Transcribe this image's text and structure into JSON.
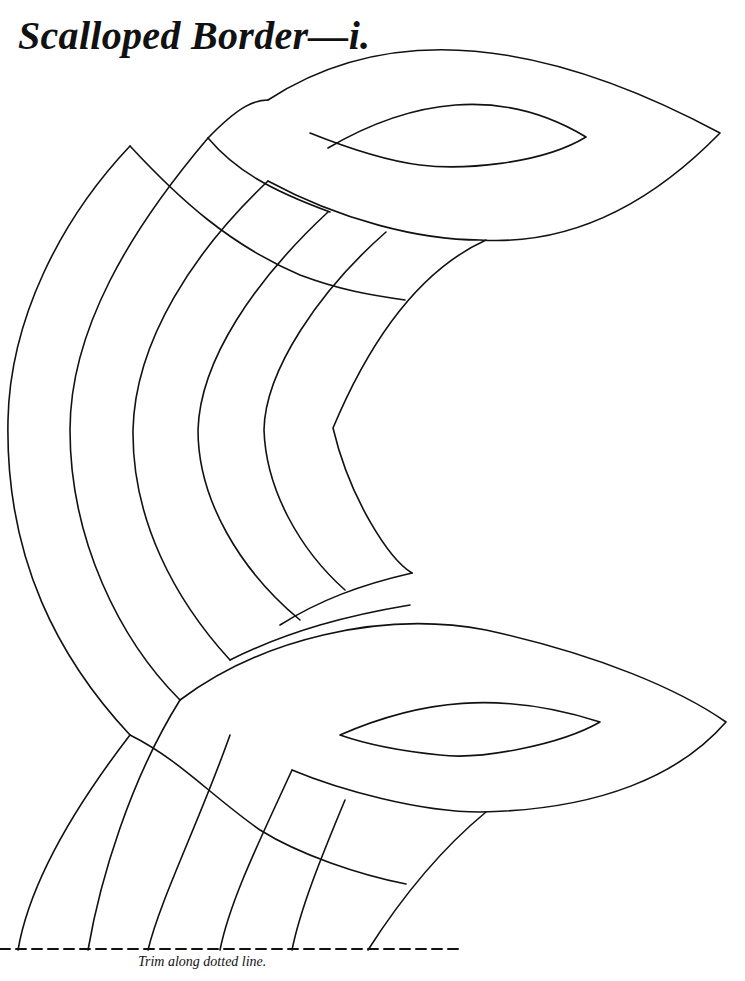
{
  "page": {
    "title": "Scalloped Border—i.",
    "caption": "Trim along dotted line."
  },
  "figure": {
    "line_color": "#111111",
    "cut_line": "dashed"
  }
}
